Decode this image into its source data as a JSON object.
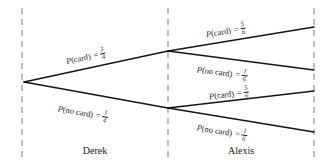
{
  "diagram": {
    "type": "probability-tree",
    "title": "",
    "background_color": "#ffffff",
    "line_color": "#151515",
    "guide_color": "#9a9a9a",
    "stages": [
      {
        "name": "Derek",
        "label": "Derek"
      },
      {
        "name": "Alexis",
        "label": "Alexis"
      }
    ],
    "branches": [
      {
        "id": "derek-card",
        "stage": "Derek",
        "event": "card",
        "p_function": "P",
        "open_paren": "(",
        "event_text": "card",
        "close_paren": ")",
        "equals": "=",
        "numerator": "3",
        "denominator": "4",
        "probability_text": "3/4",
        "label_text": "P(card) = 3/4"
      },
      {
        "id": "derek-no-card",
        "stage": "Derek",
        "event": "no card",
        "p_function": "P",
        "open_paren": "(",
        "event_text": "no card",
        "close_paren": ")",
        "equals": "=",
        "numerator": "1",
        "denominator": "4",
        "probability_text": "1/4",
        "label_text": "P(no card) = 1/4"
      },
      {
        "id": "alexis-card-upper",
        "stage": "Alexis",
        "event": "card",
        "p_function": "P",
        "open_paren": "(",
        "event_text": "card",
        "close_paren": ")",
        "equals": "=",
        "numerator": "5",
        "denominator": "6",
        "probability_text": "5/6",
        "label_text": "P(card) = 5/6"
      },
      {
        "id": "alexis-no-card-upper",
        "stage": "Alexis",
        "event": "no card",
        "p_function": "P",
        "open_paren": "(",
        "event_text": "no card",
        "close_paren": ")",
        "equals": "=",
        "numerator": "1",
        "denominator": "6",
        "probability_text": "1/6",
        "label_text": "P(no card) = 1/6"
      },
      {
        "id": "alexis-card-lower",
        "stage": "Alexis",
        "event": "card",
        "p_function": "P",
        "open_paren": "(",
        "event_text": "card",
        "close_paren": ")",
        "equals": "=",
        "numerator": "5",
        "denominator": "6",
        "probability_text": "5/6",
        "label_text": "P(card) = 5/6"
      },
      {
        "id": "alexis-no-card-lower",
        "stage": "Alexis",
        "event": "no card",
        "p_function": "P",
        "open_paren": "(",
        "event_text": "no card",
        "close_paren": ")",
        "equals": "=",
        "numerator": "1",
        "denominator": "6",
        "probability_text": "1/6",
        "label_text": "P(no card) = 1/6"
      }
    ]
  }
}
